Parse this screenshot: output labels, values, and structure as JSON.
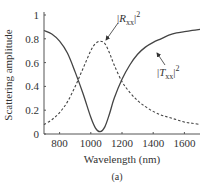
{
  "chart_data": {
    "type": "line",
    "title": "",
    "caption": "(a)",
    "xlabel": "Wavelength (nm)",
    "ylabel": "Scattering amplitude",
    "xlim": [
      700,
      1700
    ],
    "ylim": [
      0,
      1
    ],
    "xticks": [
      800,
      1000,
      1200,
      1400,
      1600
    ],
    "yticks": [
      0,
      0.2,
      0.4,
      0.6,
      0.8,
      1
    ],
    "ytick_labels": [
      "0",
      "0.2",
      "0.4",
      "0.6",
      "0.8",
      "1"
    ],
    "grid": false,
    "legend": "inline annotations with arrows",
    "x": [
      700,
      750,
      800,
      850,
      900,
      950,
      1000,
      1030,
      1060,
      1090,
      1120,
      1150,
      1200,
      1250,
      1300,
      1350,
      1400,
      1450,
      1500,
      1550,
      1600,
      1650,
      1700
    ],
    "series": [
      {
        "name": "|T_xx|^2",
        "style": "solid",
        "values": [
          0.87,
          0.84,
          0.78,
          0.68,
          0.52,
          0.34,
          0.14,
          0.05,
          0.02,
          0.06,
          0.17,
          0.3,
          0.46,
          0.58,
          0.67,
          0.73,
          0.77,
          0.8,
          0.83,
          0.85,
          0.86,
          0.87,
          0.88
        ]
      },
      {
        "name": "|R_xx|^2",
        "style": "dashed",
        "values": [
          0.08,
          0.12,
          0.18,
          0.27,
          0.4,
          0.55,
          0.7,
          0.76,
          0.78,
          0.76,
          0.68,
          0.58,
          0.44,
          0.35,
          0.28,
          0.23,
          0.19,
          0.16,
          0.14,
          0.12,
          0.1,
          0.09,
          0.08
        ]
      }
    ],
    "annotations": [
      {
        "label_main": "|R",
        "label_sub": "xx",
        "label_end": "|",
        "label_sup": "2",
        "target_series": "|R_xx|^2"
      },
      {
        "label_main": "|T",
        "label_sub": "xx",
        "label_end": "|",
        "label_sup": "2",
        "target_series": "|T_xx|^2"
      }
    ]
  }
}
